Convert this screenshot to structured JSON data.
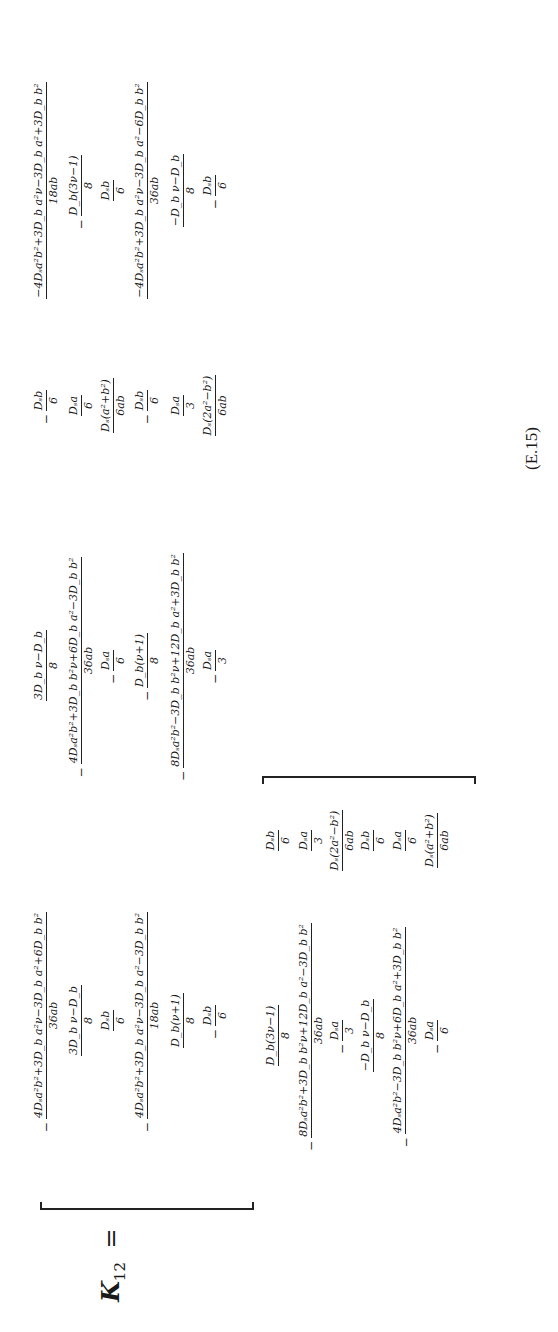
{
  "equation": {
    "lhs_symbol": "K",
    "lhs_subscript": "12",
    "equals": "=",
    "number": "(E.15)"
  },
  "matrix": {
    "columns": [
      {
        "entries": [
          {
            "neg": "−",
            "num": "4Dₛa²b²+3D_b a²ν−3D_b a²+6D_b b²",
            "den": "36ab"
          },
          {
            "neg": "",
            "num": "3D_b ν−D_b",
            "den": "8"
          },
          {
            "neg": "",
            "num": "Dₛb",
            "den": "6"
          },
          {
            "neg": "−",
            "num": "4Dₛa²b²+3D_b a²ν−3D_b a²−3D_b b²",
            "den": "18ab"
          },
          {
            "neg": "",
            "num": "D_b(ν+1)",
            "den": "8"
          },
          {
            "neg": "−",
            "num": "Dₛb",
            "den": "6"
          }
        ]
      },
      {
        "entries": [
          {
            "neg": "",
            "num": "3D_b ν−D_b",
            "den": "8"
          },
          {
            "neg": "−",
            "num": "4Dₛa²b²+3D_b b²ν+6D_b a²−3D_b b²",
            "den": "36ab"
          },
          {
            "neg": "−",
            "num": "Dₛa",
            "den": "6"
          },
          {
            "neg": "−",
            "num": "D_b(ν+1)",
            "den": "8"
          },
          {
            "neg": "−",
            "num": "8Dₛa²b²−3D_b b²ν+12D_b a²+3D_b b²",
            "den": "36ab"
          },
          {
            "neg": "−",
            "num": "Dₛa",
            "den": "3"
          }
        ]
      },
      {
        "entries": [
          {
            "neg": "−",
            "num": "Dₛb",
            "den": "6"
          },
          {
            "neg": "",
            "num": "Dₛa",
            "den": "6"
          },
          {
            "neg": "",
            "num": "Dₛ(a²+b²)",
            "den": "6ab"
          },
          {
            "neg": "−",
            "num": "Dₛb",
            "den": "6"
          },
          {
            "neg": "",
            "num": "Dₛa",
            "den": "3"
          },
          {
            "neg": "",
            "num": "Dₛ(2a²−b²)",
            "den": "6ab"
          }
        ]
      },
      {
        "entries": [
          {
            "neg": "",
            "num": "−4Dₛa²b²+3D_b a²ν−3D_b a²+3D_b b²",
            "den": "18ab"
          },
          {
            "neg": "−",
            "num": "D_b(3ν−1)",
            "den": "8"
          },
          {
            "neg": "",
            "num": "Dₛb",
            "den": "6"
          },
          {
            "neg": "",
            "num": "−4Dₛa²b²+3D_b a²ν−3D_b a²−6D_b b²",
            "den": "36ab"
          },
          {
            "neg": "",
            "num": "−D_b ν−D_b",
            "den": "8"
          },
          {
            "neg": "−",
            "num": "Dₛb",
            "den": "6"
          }
        ]
      },
      {
        "entries": [
          {
            "neg": "",
            "num": "D_b(3ν−1)",
            "den": "8"
          },
          {
            "neg": "−",
            "num": "8Dₛa²b²+3D_b b²ν+12D_b a²−3D_b b²",
            "den": "36ab"
          },
          {
            "neg": "−",
            "num": "Dₛa",
            "den": "3"
          },
          {
            "neg": "",
            "num": "−D_b ν−D_b",
            "den": "8"
          },
          {
            "neg": "−",
            "num": "4Dₛa²b²−3D_b b²ν+6D_b a²+3D_b b²",
            "den": "36ab"
          },
          {
            "neg": "−",
            "num": "Dₛa",
            "den": "6"
          }
        ]
      },
      {
        "entries": [
          {
            "neg": "",
            "num": "Dₛb",
            "den": "6"
          },
          {
            "neg": "",
            "num": "Dₛa",
            "den": "3"
          },
          {
            "neg": "",
            "num": "Dₛ(2a²−b²)",
            "den": "6ab"
          },
          {
            "neg": "",
            "num": "Dₛb",
            "den": "6"
          },
          {
            "neg": "",
            "num": "Dₛa",
            "den": "6"
          },
          {
            "neg": "",
            "num": "Dₛ(a²+b²)",
            "den": "6ab"
          }
        ]
      }
    ]
  }
}
